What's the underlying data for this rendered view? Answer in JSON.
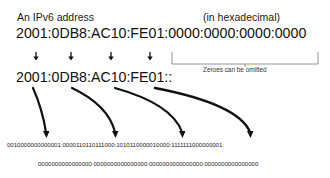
{
  "diagram": {
    "title": "An IPv6 address",
    "notation": "(in hexadecimal)",
    "full_address": "2001:0DB8:AC10:FE01:0000:0000:0000:0000",
    "compressed_address": "2001:0DB8:AC10:FE01::",
    "omission_note": "Zeroes can be omitted",
    "binary_line_1": "0010000000000001:0000110110111000:1010110000010000:1111111000000001:",
    "binary_line_2": "0000000000000000:0000000000000000:0000000000000000:0000000000000000",
    "groups": [
      {
        "hex": "2001",
        "binary": "0010000000000001"
      },
      {
        "hex": "0DB8",
        "binary": "0000110110111000"
      },
      {
        "hex": "AC10",
        "binary": "1010110000010000"
      },
      {
        "hex": "FE01",
        "binary": "1111111000000001"
      },
      {
        "hex": "0000",
        "binary": "0000000000000000"
      },
      {
        "hex": "0000",
        "binary": "0000000000000000"
      },
      {
        "hex": "0000",
        "binary": "0000000000000000"
      },
      {
        "hex": "0000",
        "binary": "0000000000000000"
      }
    ],
    "colors": {
      "text": "#111111",
      "background": "#ffffff",
      "lines": "#111111"
    }
  }
}
